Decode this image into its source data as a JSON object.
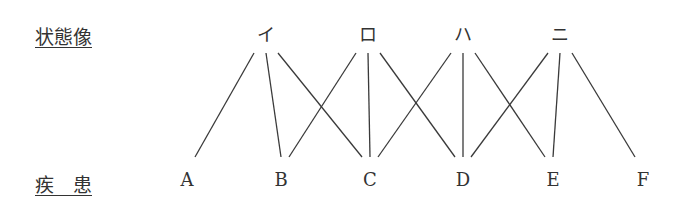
{
  "labels": {
    "top_row": "状態像",
    "bottom_row": "疾　患"
  },
  "top_nodes": [
    {
      "id": "i",
      "label": "イ",
      "x": 266
    },
    {
      "id": "ro",
      "label": "ロ",
      "x": 368
    },
    {
      "id": "ha",
      "label": "ハ",
      "x": 463
    },
    {
      "id": "ni",
      "label": "ニ",
      "x": 560
    }
  ],
  "bottom_nodes": [
    {
      "id": "A",
      "label": "A",
      "x": 187
    },
    {
      "id": "B",
      "label": "B",
      "x": 281
    },
    {
      "id": "C",
      "label": "C",
      "x": 370
    },
    {
      "id": "D",
      "label": "D",
      "x": 463
    },
    {
      "id": "E",
      "label": "E",
      "x": 553
    },
    {
      "id": "F",
      "label": "F",
      "x": 643
    }
  ],
  "edges": [
    {
      "from": "i",
      "to": "A"
    },
    {
      "from": "i",
      "to": "B"
    },
    {
      "from": "i",
      "to": "C"
    },
    {
      "from": "ro",
      "to": "B"
    },
    {
      "from": "ro",
      "to": "C"
    },
    {
      "from": "ro",
      "to": "D"
    },
    {
      "from": "ha",
      "to": "C"
    },
    {
      "from": "ha",
      "to": "D"
    },
    {
      "from": "ha",
      "to": "E"
    },
    {
      "from": "ni",
      "to": "D"
    },
    {
      "from": "ni",
      "to": "E"
    },
    {
      "from": "ni",
      "to": "F"
    }
  ],
  "line_color": "#3a3a3a"
}
